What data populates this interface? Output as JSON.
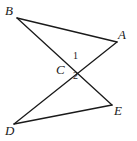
{
  "figure": {
    "type": "geometry-diagram",
    "background_color": "#ffffff",
    "line_color": "#1a1a1a",
    "line_width": 1.3,
    "width": 137,
    "height": 141,
    "points": [
      {
        "name": "B",
        "label": "B",
        "x": 17,
        "y": 18,
        "label_x": 5,
        "label_y": 4
      },
      {
        "name": "A",
        "label": "A",
        "x": 117,
        "y": 42,
        "label_x": 118,
        "label_y": 28
      },
      {
        "name": "C",
        "label": "C",
        "x": 72,
        "y": 69,
        "label_x": 56,
        "label_y": 63
      },
      {
        "name": "D",
        "label": "D",
        "x": 14,
        "y": 124,
        "label_x": 5,
        "label_y": 124
      },
      {
        "name": "E",
        "label": "E",
        "x": 112,
        "y": 105,
        "label_x": 114,
        "label_y": 104
      }
    ],
    "segments": [
      {
        "name": "segment-BA",
        "from": "B",
        "to": "A",
        "x1": 17,
        "y1": 18,
        "x2": 117,
        "y2": 42
      },
      {
        "name": "segment-BE",
        "from": "B",
        "to": "E",
        "x1": 17,
        "y1": 18,
        "x2": 112,
        "y2": 105
      },
      {
        "name": "segment-AD",
        "from": "A",
        "to": "D",
        "x1": 117,
        "y1": 42,
        "x2": 14,
        "y2": 124
      },
      {
        "name": "segment-DE",
        "from": "D",
        "to": "E",
        "x1": 14,
        "y1": 124,
        "x2": 112,
        "y2": 105
      }
    ],
    "angles": [
      {
        "name": "angle-1",
        "label": "1",
        "x": 73,
        "y": 51
      },
      {
        "name": "angle-2",
        "label": "2",
        "x": 73,
        "y": 71
      }
    ]
  }
}
